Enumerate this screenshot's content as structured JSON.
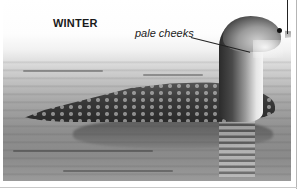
{
  "figure": {
    "season_heading": "WINTER",
    "callouts": [
      {
        "label": "pale cheeks"
      }
    ],
    "truncated_top_label": "",
    "photo_subject": "loon-winter-plumage",
    "colors": {
      "heading_text": "#1a1a1a",
      "callout_text": "#222222",
      "leader_line": "#222222",
      "border_rule": "#b5b5b5"
    }
  }
}
